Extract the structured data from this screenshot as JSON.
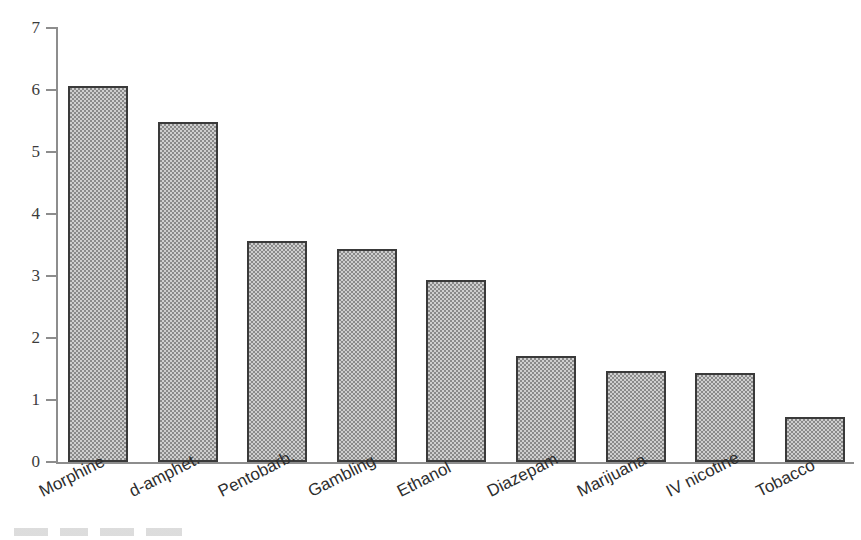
{
  "chart_data": {
    "type": "bar",
    "title": "",
    "subtitle": "",
    "xlabel": "",
    "ylabel": "",
    "categories": [
      "Morphine",
      "d-amphet.",
      "Pentobarb.",
      "Gambling",
      "Ethanol",
      "Diazepam",
      "Marijuana",
      "IV nicotine",
      "Tobacco"
    ],
    "values": [
      6.07,
      5.48,
      3.56,
      3.43,
      2.93,
      1.71,
      1.46,
      1.44,
      0.72
    ],
    "ylim": [
      0,
      7
    ],
    "yticks": [
      0,
      1,
      2,
      3,
      4,
      5,
      6,
      7
    ],
    "ytick_labels": [
      "0",
      "1",
      "2",
      "3",
      "4",
      "5",
      "6",
      "7"
    ],
    "grid": false,
    "legend": null,
    "bar_fill": "#a8a8a8",
    "bar_edge": "#3a3a3a",
    "axis_color": "#8d8d8d",
    "background": "#ffffff",
    "annotations": []
  },
  "axis": {
    "y_label_0": "0",
    "y_label_1": "1",
    "y_label_2": "2",
    "y_label_3": "3",
    "y_label_4": "4",
    "y_label_5": "5",
    "y_label_6": "6",
    "y_label_7": "7"
  },
  "bars": [
    {
      "label": "Morphine",
      "value": 6.07
    },
    {
      "label": "d-amphet.",
      "value": 5.48
    },
    {
      "label": "Pentobarb.",
      "value": 3.56
    },
    {
      "label": "Gambling",
      "value": 3.43
    },
    {
      "label": "Ethanol",
      "value": 2.93
    },
    {
      "label": "Diazepam",
      "value": 1.71
    },
    {
      "label": "Marijuana",
      "value": 1.46
    },
    {
      "label": "IV nicotine",
      "value": 1.44
    },
    {
      "label": "Tobacco",
      "value": 0.72
    }
  ]
}
